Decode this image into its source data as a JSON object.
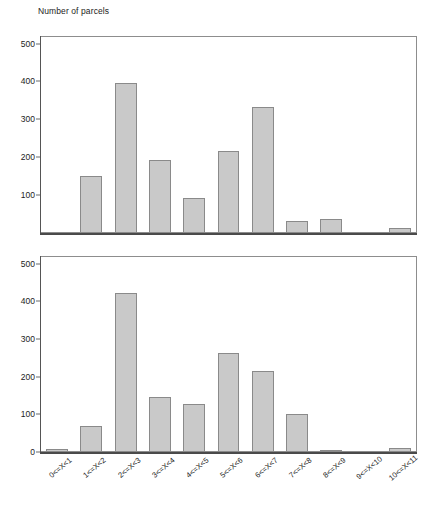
{
  "chart_data": {
    "type": "bar",
    "title": "Number of parcels",
    "xlabel": "",
    "ylabel": "Number of parcels",
    "ylim": [
      0,
      520
    ],
    "grid": false,
    "legend": null,
    "categories": [
      "0<=X<1",
      "1<=X<2",
      "2<=X<3",
      "3<=X<4",
      "4<=X<5",
      "5<=X<6",
      "6<=X<7",
      "7<=X<8",
      "8<=X<9",
      "9<=X<10",
      "10<=X<11"
    ],
    "panels": [
      {
        "name": "top-panel",
        "yticks": [
          100,
          200,
          300,
          400,
          500
        ],
        "ytick_labels": [
          "100",
          "200",
          "300",
          "400",
          "500"
        ],
        "values": [
          0,
          151,
          395,
          192,
          92,
          216,
          332,
          31,
          38,
          0,
          12
        ]
      },
      {
        "name": "bottom-panel",
        "yticks": [
          0,
          100,
          200,
          300,
          400,
          500
        ],
        "ytick_labels": [
          "0",
          "100",
          "200",
          "300",
          "400",
          "500"
        ],
        "values": [
          7,
          68,
          422,
          147,
          127,
          263,
          214,
          102,
          5,
          0,
          10
        ]
      }
    ],
    "colors": {
      "bar_fill": "#c9c9c9",
      "bar_stroke": "#8a8a8a",
      "axis": "#4a4a4a",
      "frame": "#8d8d8d",
      "text": "#1c1c1c",
      "background": "#ffffff"
    }
  }
}
